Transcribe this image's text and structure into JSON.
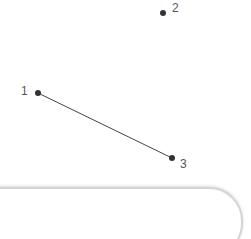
{
  "puzzle": {
    "points": [
      {
        "label": "1",
        "x": 38,
        "y": 93
      },
      {
        "label": "2",
        "x": 163,
        "y": 13
      },
      {
        "label": "3",
        "x": 172,
        "y": 158
      }
    ],
    "lines": [
      {
        "from": "1",
        "to": "3"
      }
    ],
    "dot_color": "#333333",
    "line_color": "#444444"
  },
  "answer_box": {
    "value": ""
  }
}
